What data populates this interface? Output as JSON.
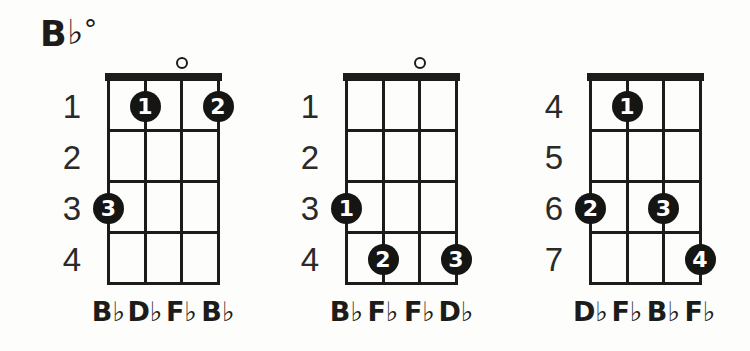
{
  "title": {
    "root": "B",
    "flat": "♭",
    "symbol": "°"
  },
  "colors": {
    "ink": "#1c1c1a",
    "background": "#fdfdfb",
    "dot_fill": "#151513",
    "dot_text": "#ffffff"
  },
  "diagrams": [
    {
      "fret_labels": [
        "1",
        "2",
        "3",
        "4"
      ],
      "open_strings": [
        3
      ],
      "fingers": [
        {
          "string": 2,
          "fret_row": 1,
          "label": "1"
        },
        {
          "string": 4,
          "fret_row": 1,
          "label": "2"
        },
        {
          "string": 1,
          "fret_row": 3,
          "label": "3"
        }
      ],
      "notes": [
        "B♭",
        "D♭",
        "F♭",
        "B♭"
      ]
    },
    {
      "fret_labels": [
        "1",
        "2",
        "3",
        "4"
      ],
      "open_strings": [
        3
      ],
      "fingers": [
        {
          "string": 1,
          "fret_row": 3,
          "label": "1"
        },
        {
          "string": 2,
          "fret_row": 4,
          "label": "2"
        },
        {
          "string": 4,
          "fret_row": 4,
          "label": "3"
        }
      ],
      "notes": [
        "B♭",
        "F♭",
        "F♭",
        "D♭"
      ]
    },
    {
      "fret_labels": [
        "4",
        "5",
        "6",
        "7"
      ],
      "open_strings": [],
      "fingers": [
        {
          "string": 2,
          "fret_row": 1,
          "label": "1"
        },
        {
          "string": 1,
          "fret_row": 3,
          "label": "2"
        },
        {
          "string": 3,
          "fret_row": 3,
          "label": "3"
        },
        {
          "string": 4,
          "fret_row": 4,
          "label": "4"
        }
      ],
      "notes": [
        "D♭",
        "F♭",
        "B♭",
        "F♭"
      ]
    }
  ]
}
